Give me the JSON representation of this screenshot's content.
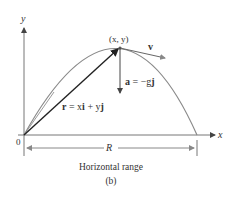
{
  "figure": {
    "axes": {
      "x_label": "x",
      "y_label": "y",
      "origin_label": "0"
    },
    "point_label": "(x, y)",
    "velocity_label": "v",
    "acceleration_label": {
      "a": "a",
      "eq": " = −g",
      "j": "j"
    },
    "position_label": {
      "r": "r",
      "eq1": " = x",
      "i": "i",
      "plus": " + y",
      "j": "j"
    },
    "range_label": "R",
    "caption": "Horizontal range",
    "subcaption": "(b)",
    "colors": {
      "axis": "#777777",
      "trajectory": "#8a8a8a",
      "vector": "#222222"
    }
  }
}
